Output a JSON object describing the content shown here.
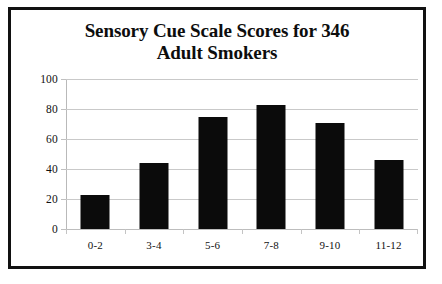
{
  "figure": {
    "frame_color": "#111111",
    "background": "#ffffff"
  },
  "chart_data": {
    "type": "bar",
    "title": "Sensory Cue Scale Scores for 346 Adult Smokers",
    "title_lines": [
      "Sensory Cue Scale Scores for 346",
      "Adult Smokers"
    ],
    "categories": [
      "0-2",
      "3-4",
      "5-6",
      "7-8",
      "9-10",
      "11-12"
    ],
    "values": [
      23,
      44,
      75,
      83,
      71,
      46
    ],
    "xlabel": "",
    "ylabel": "",
    "ylim": [
      0,
      100
    ],
    "yticks": [
      0,
      20,
      40,
      60,
      80,
      100
    ],
    "ytick_labels": [
      "0",
      "20",
      "40",
      "60",
      "80",
      "100"
    ],
    "grid": true,
    "grid_axis": "y",
    "grid_color": "#c9c9c9",
    "legend": false,
    "bar_color": "#0b0b0b"
  }
}
